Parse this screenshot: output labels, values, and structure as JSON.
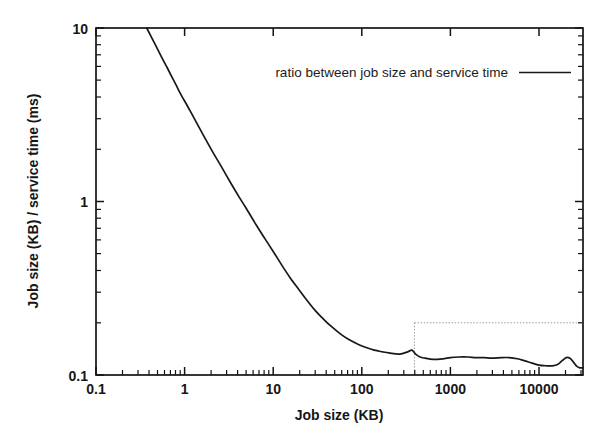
{
  "figure": {
    "background": "#ffffff",
    "line_color": "#181818",
    "inset_box_color": "#9a9a9a"
  },
  "chart_data": {
    "type": "line",
    "title": "",
    "subtitle": "",
    "xlabel": "Job size (KB)",
    "ylabel": "Job size (KB) / service time (ms)",
    "xscale": "log",
    "yscale": "log",
    "xlim": [
      0.1,
      60000
    ],
    "ylim": [
      0.1,
      10
    ],
    "grid": false,
    "legend_position": "top-center-right",
    "xticks": [
      0.1,
      1,
      10,
      100,
      1000,
      10000
    ],
    "xtick_labels": [
      "0.1",
      "1",
      "10",
      "100",
      "1000",
      "10000"
    ],
    "yticks": [
      0.1,
      1,
      10
    ],
    "ytick_labels": [
      "0.1",
      "1",
      "10"
    ],
    "annotations": [
      {
        "kind": "dotted-rectangle",
        "label": "inset region marker",
        "x_range": [
          600,
          60000
        ],
        "y_range": [
          0.1,
          0.2
        ]
      }
    ],
    "series": [
      {
        "name": "ratio between job size and service time",
        "legend_label": "ratio between job size and service time",
        "color": "#181818",
        "style": "solid",
        "points": [
          [
            0.4,
            10.0
          ],
          [
            0.5,
            8.1
          ],
          [
            0.6,
            6.8
          ],
          [
            0.7,
            5.9
          ],
          [
            0.8,
            5.2
          ],
          [
            0.9,
            4.65
          ],
          [
            1.0,
            4.2
          ],
          [
            1.3,
            3.35
          ],
          [
            1.6,
            2.78
          ],
          [
            2.0,
            2.28
          ],
          [
            2.5,
            1.88
          ],
          [
            3.0,
            1.62
          ],
          [
            4.0,
            1.27
          ],
          [
            5.0,
            1.06
          ],
          [
            6.0,
            0.92
          ],
          [
            8.0,
            0.73
          ],
          [
            10.0,
            0.615
          ],
          [
            13.0,
            0.505
          ],
          [
            16.0,
            0.43
          ],
          [
            20.0,
            0.365
          ],
          [
            25.0,
            0.315
          ],
          [
            30.0,
            0.28
          ],
          [
            40.0,
            0.235
          ],
          [
            50.0,
            0.21
          ],
          [
            60.0,
            0.193
          ],
          [
            80.0,
            0.172
          ],
          [
            100.0,
            0.16
          ],
          [
            130.0,
            0.15
          ],
          [
            160.0,
            0.144
          ],
          [
            200.0,
            0.139
          ],
          [
            250.0,
            0.136
          ],
          [
            300.0,
            0.134
          ],
          [
            400.0,
            0.132
          ],
          [
            500.0,
            0.136
          ],
          [
            560.0,
            0.139
          ],
          [
            620.0,
            0.132
          ],
          [
            700.0,
            0.127
          ],
          [
            800.0,
            0.125
          ],
          [
            1000.0,
            0.123
          ],
          [
            1300.0,
            0.124
          ],
          [
            1600.0,
            0.126
          ],
          [
            2000.0,
            0.127
          ],
          [
            2600.0,
            0.127
          ],
          [
            3200.0,
            0.126
          ],
          [
            4000.0,
            0.126
          ],
          [
            5000.0,
            0.125
          ],
          [
            6500.0,
            0.126
          ],
          [
            8000.0,
            0.126
          ],
          [
            10000.0,
            0.124
          ],
          [
            12000.0,
            0.121
          ],
          [
            15000.0,
            0.117
          ],
          [
            18000.0,
            0.114
          ],
          [
            22000.0,
            0.113
          ],
          [
            26000.0,
            0.113
          ],
          [
            30000.0,
            0.115
          ],
          [
            34000.0,
            0.121
          ],
          [
            38000.0,
            0.126
          ],
          [
            42000.0,
            0.125
          ],
          [
            46000.0,
            0.119
          ],
          [
            50000.0,
            0.113
          ],
          [
            55000.0,
            0.11
          ],
          [
            60000.0,
            0.11
          ]
        ]
      }
    ]
  },
  "axes": {
    "x_title": "Job size (KB)",
    "y_title": "Job size (KB) / service time (ms)",
    "x_tick_labels": [
      "0.1",
      "1",
      "10",
      "100",
      "1000",
      "10000"
    ],
    "y_tick_labels": [
      "10",
      "1",
      "0.1"
    ]
  },
  "legend": {
    "entries": [
      {
        "label": "ratio between job size and service time",
        "sample": "solid-line"
      }
    ]
  }
}
